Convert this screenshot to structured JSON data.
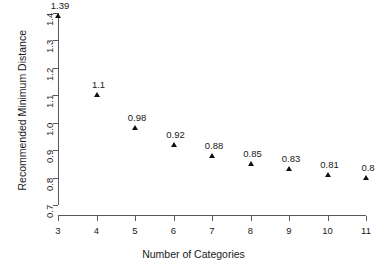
{
  "chart_data": {
    "type": "scatter",
    "title": "",
    "subtitle": "",
    "xlabel": "Number of Categories",
    "ylabel": "Recommended Minimum Distance",
    "x": [
      3,
      4,
      5,
      6,
      7,
      8,
      9,
      10,
      11
    ],
    "values": [
      1.39,
      1.1,
      0.98,
      0.92,
      0.88,
      0.85,
      0.83,
      0.81,
      0.8
    ],
    "point_labels": [
      "1.39",
      "1.1",
      "0.98",
      "0.92",
      "0.88",
      "0.85",
      "0.83",
      "0.81",
      "0.8"
    ],
    "xlim": [
      3,
      11
    ],
    "ylim": [
      0.7,
      1.4
    ],
    "xticks": [
      3,
      4,
      5,
      6,
      7,
      8,
      9,
      10,
      11
    ],
    "xtick_labels": [
      "3",
      "4",
      "5",
      "6",
      "7",
      "8",
      "9",
      "10",
      "11"
    ],
    "yticks": [
      0.7,
      0.8,
      0.9,
      1.0,
      1.1,
      1.2,
      1.3,
      1.4
    ],
    "ytick_labels": [
      "0.7",
      "0.8",
      "0.9",
      "1.0",
      "1.1",
      "1.2",
      "1.3",
      "1.4"
    ],
    "grid": false,
    "legend": null,
    "marker": "filled-triangle",
    "marker_color": "#111111",
    "axis_color": "#595959",
    "background": "#ffffff"
  }
}
